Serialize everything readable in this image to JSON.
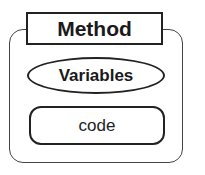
{
  "diagram": {
    "title": "Method",
    "variables_label": "Variables",
    "code_label": "code"
  }
}
